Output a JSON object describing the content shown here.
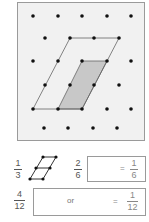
{
  "diagram": {
    "type": "dot-grid-fraction-illustration",
    "grid_panel": {
      "background": "#f1f1f1",
      "border": "#9a9a9a",
      "dots": [
        [
          33,
          16
        ],
        [
          58,
          16
        ],
        [
          82,
          16
        ],
        [
          107,
          16
        ],
        [
          131,
          16
        ],
        [
          45,
          38
        ],
        [
          70,
          38
        ],
        [
          94,
          38
        ],
        [
          119,
          38
        ],
        [
          33,
          61
        ],
        [
          58,
          61
        ],
        [
          82,
          61
        ],
        [
          107,
          61
        ],
        [
          131,
          61
        ],
        [
          45,
          85
        ],
        [
          70,
          85
        ],
        [
          94,
          85
        ],
        [
          119,
          85
        ],
        [
          33,
          109
        ],
        [
          58,
          109
        ],
        [
          82,
          109
        ],
        [
          107,
          109
        ],
        [
          131,
          109
        ],
        [
          44,
          128
        ],
        [
          68,
          128
        ],
        [
          93,
          128
        ],
        [
          117,
          128
        ]
      ],
      "outline_parallelogram": [
        [
          33,
          109
        ],
        [
          70,
          38
        ],
        [
          119,
          38
        ],
        [
          82,
          109
        ]
      ],
      "shaded_parallelogram": [
        [
          58,
          109
        ],
        [
          82,
          61
        ],
        [
          107,
          61
        ],
        [
          82,
          109
        ]
      ],
      "shade_color": "#c8c8c8"
    },
    "row1": {
      "fraction_left": {
        "num": "1",
        "den": "3"
      },
      "fraction_mid": {
        "num": "2",
        "den": "6"
      },
      "equals": "=",
      "fraction_right": {
        "num": "1",
        "den": "6"
      }
    },
    "row2": {
      "fraction_left": {
        "num": "4",
        "den": "12"
      },
      "or_label": "or",
      "equals": "=",
      "fraction_right": {
        "num": "1",
        "den": "12"
      }
    }
  }
}
